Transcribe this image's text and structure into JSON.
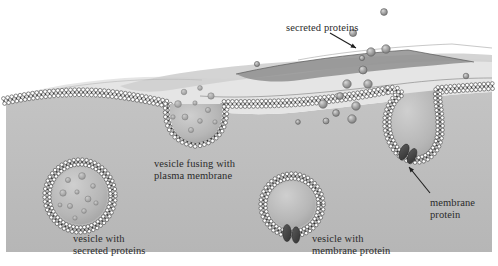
{
  "figure": {
    "type": "cell-biology-diagram"
  },
  "colors": {
    "extracellular": "#ffffff",
    "cytoplasm": "#bfbfbf",
    "cytoplasm_dark": "#a9a9a9",
    "surface_light": "#ebebeb",
    "surface_mid": "#d4d4d4",
    "surface_dark": "#9a9a9a",
    "membrane_head": "#ffffff",
    "membrane_head_stroke": "#3c3c3c",
    "membrane_tail": "#2e2e2e",
    "membrane_protein": "#4a4a4a",
    "secreted_protein": "#9c9c9c",
    "secreted_protein_stroke": "#5e5e5e",
    "label_text": "#2b2b2b",
    "arrow": "#1f1f1f",
    "vesicle_lumen": "#b4b4b4",
    "vesicle_lumen_light": "#c6c6c6"
  },
  "labels": [
    {
      "name": "secreted-proteins",
      "lines": [
        "secreted proteins"
      ],
      "x": 286,
      "y": 22,
      "align": "left"
    },
    {
      "name": "vesicle-fusing",
      "lines": [
        "vesicle fusing with",
        "plasma membrane"
      ],
      "x": 154,
      "y": 158,
      "align": "left"
    },
    {
      "name": "vesicle-secreted-proteins",
      "lines": [
        "vesicle with",
        "secreted proteins"
      ],
      "x": 73,
      "y": 233,
      "align": "left"
    },
    {
      "name": "vesicle-membrane-protein",
      "lines": [
        "vesicle with",
        "membrane protein"
      ],
      "x": 312,
      "y": 233,
      "align": "left"
    },
    {
      "name": "membrane-protein",
      "lines": [
        "membrane",
        "protein"
      ],
      "x": 430,
      "y": 197,
      "align": "left"
    }
  ],
  "arrows": [
    {
      "name": "arrow-secreted-proteins",
      "x1": 330,
      "y1": 33,
      "x2": 356,
      "y2": 48
    },
    {
      "name": "arrow-membrane-protein",
      "x1": 430,
      "y1": 193,
      "x2": 409,
      "y2": 167
    }
  ],
  "secreted_proteins": [
    {
      "cx": 384,
      "cy": 12,
      "r": 3.4
    },
    {
      "cx": 353,
      "cy": 33,
      "r": 3.6
    },
    {
      "cx": 371,
      "cy": 52,
      "r": 4.2
    },
    {
      "cx": 386,
      "cy": 49,
      "r": 4.2
    },
    {
      "cx": 362,
      "cy": 58,
      "r": 2.6
    },
    {
      "cx": 363,
      "cy": 70,
      "r": 4.0
    },
    {
      "cx": 347,
      "cy": 84,
      "r": 4.2
    },
    {
      "cx": 368,
      "cy": 84,
      "r": 4.2
    },
    {
      "cx": 340,
      "cy": 96,
      "r": 3.4
    },
    {
      "cx": 323,
      "cy": 104,
      "r": 4.2
    },
    {
      "cx": 356,
      "cy": 106,
      "r": 4.2
    },
    {
      "cx": 336,
      "cy": 113,
      "r": 3.4
    },
    {
      "cx": 352,
      "cy": 119,
      "r": 4.2
    },
    {
      "cx": 326,
      "cy": 121,
      "r": 3.0
    },
    {
      "cx": 298,
      "cy": 122,
      "r": 2.4
    },
    {
      "cx": 257,
      "cy": 64,
      "r": 2.6
    },
    {
      "cx": 466,
      "cy": 76,
      "r": 2.8
    }
  ],
  "vesicles": [
    {
      "name": "vesicle-secreted-proteins",
      "cx": 80,
      "cy": 196,
      "rx": 33,
      "ry": 34,
      "cargo": true,
      "protein": false
    },
    {
      "name": "vesicle-fusing",
      "cx": 196,
      "cy": 112,
      "rx": 34,
      "ry": 33,
      "cargo": true,
      "protein": false
    },
    {
      "name": "vesicle-membrane-protein",
      "cx": 292,
      "cy": 205,
      "rx": 29,
      "ry": 29,
      "cargo": false,
      "protein": true
    },
    {
      "name": "vesicle-fusing-right",
      "cx": 413,
      "cy": 148,
      "rx": 30,
      "ry": 32,
      "cargo": false,
      "protein": true
    }
  ],
  "cargo_dots": [
    {
      "cx": 68,
      "cy": 180,
      "r": 2.6
    },
    {
      "cx": 82,
      "cy": 176,
      "r": 3.4
    },
    {
      "cx": 93,
      "cy": 186,
      "r": 2.4
    },
    {
      "cx": 63,
      "cy": 193,
      "r": 3.2
    },
    {
      "cx": 77,
      "cy": 192,
      "r": 2.2
    },
    {
      "cx": 88,
      "cy": 199,
      "r": 3.0
    },
    {
      "cx": 70,
      "cy": 206,
      "r": 2.6
    },
    {
      "cx": 84,
      "cy": 211,
      "r": 2.4
    },
    {
      "cx": 96,
      "cy": 203,
      "r": 2.2
    },
    {
      "cx": 60,
      "cy": 205,
      "r": 2.0
    },
    {
      "cx": 75,
      "cy": 218,
      "r": 2.2
    }
  ],
  "fusing_cargo_dots": [
    {
      "cx": 184,
      "cy": 92,
      "r": 2.8
    },
    {
      "cx": 200,
      "cy": 88,
      "r": 2.4
    },
    {
      "cx": 211,
      "cy": 96,
      "r": 3.2
    },
    {
      "cx": 178,
      "cy": 104,
      "r": 3.4
    },
    {
      "cx": 195,
      "cy": 103,
      "r": 2.2
    },
    {
      "cx": 208,
      "cy": 110,
      "r": 2.6
    },
    {
      "cx": 185,
      "cy": 117,
      "r": 3.0
    },
    {
      "cx": 200,
      "cy": 121,
      "r": 2.4
    },
    {
      "cx": 215,
      "cy": 122,
      "r": 2.2
    },
    {
      "cx": 173,
      "cy": 117,
      "r": 2.2
    },
    {
      "cx": 191,
      "cy": 130,
      "r": 2.6
    }
  ]
}
